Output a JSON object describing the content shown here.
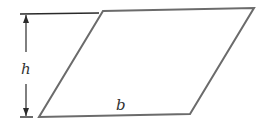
{
  "diagram": {
    "labels": {
      "height": "h",
      "base": "b"
    },
    "colors": {
      "shape_stroke": "#6b6b6b",
      "dimension_line": "#2a2a2a",
      "label": "#333333"
    },
    "shape": {
      "type": "parallelogram",
      "vertices": [
        [
          103,
          11
        ],
        [
          254,
          8
        ],
        [
          190,
          114
        ],
        [
          39,
          117
        ]
      ]
    },
    "height_dimension": {
      "x": 26,
      "top_y": 14,
      "bottom_y": 117
    }
  }
}
